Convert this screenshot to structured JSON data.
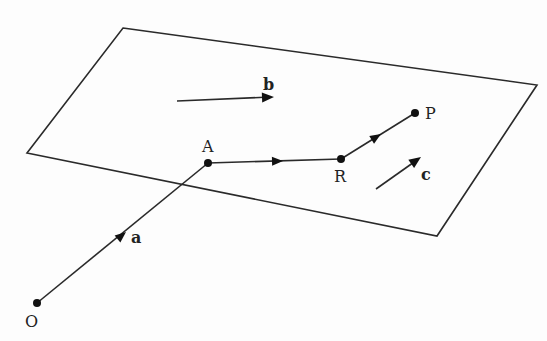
{
  "colors": {
    "ink": "#2a2a2a",
    "background": "#fdfdfd"
  },
  "points": {
    "O": {
      "label": "O"
    },
    "A": {
      "label": "A"
    },
    "R": {
      "label": "R"
    },
    "P": {
      "label": "P"
    }
  },
  "vectors": {
    "a": {
      "label": "a",
      "from": "O",
      "to": "A"
    },
    "b": {
      "label": "b",
      "free": true
    },
    "c": {
      "label": "c",
      "free": true
    },
    "AR": {
      "label": "",
      "from": "A",
      "to": "R",
      "parallel_to": "b"
    },
    "RP": {
      "label": "",
      "from": "R",
      "to": "P",
      "parallel_to": "c"
    }
  },
  "plane": {
    "label": ""
  }
}
